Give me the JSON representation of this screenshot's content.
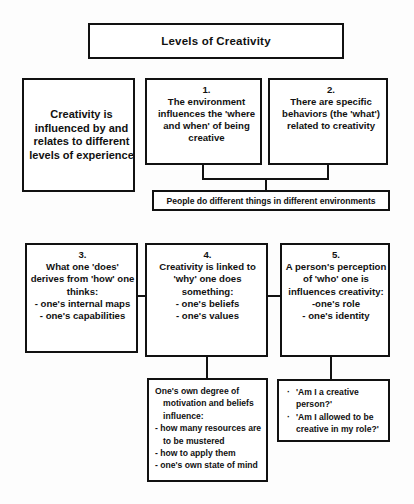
{
  "diagram": {
    "title": "Levels of Creativity",
    "intro": {
      "text": "Creativity is influenced by and relates to different levels of experience"
    },
    "level1": {
      "number": "1.",
      "text": "The environment influences the 'where and when' of being creative"
    },
    "level2": {
      "number": "2.",
      "text": "There are specific behaviors (the 'what') related to creativity"
    },
    "environment_note": "People do different things in different environments",
    "level3": {
      "number": "3.",
      "heading": "What one 'does' derives from 'how' one thinks:",
      "items": [
        "- one's internal maps",
        "- one's capabilities"
      ]
    },
    "level4": {
      "number": "4.",
      "heading": "Creativity is linked to 'why' one does something:",
      "items": [
        "- one's beliefs",
        "- one's values"
      ]
    },
    "level5": {
      "number": "5.",
      "heading": "A person's perception of 'who' one is influences creativity:",
      "items": [
        "-one's role",
        "- one's identity"
      ]
    },
    "detail4": {
      "lead": "One's own degree of",
      "lead2": "motivation and beliefs",
      "lead3": "influence:",
      "item1": "- how many resources are",
      "item1b": "to be mustered",
      "item2": "- how to apply them",
      "item3": "- one's own state of mind"
    },
    "detail5": {
      "bullet_glyph": "·",
      "item1a": "'Am I a creative",
      "item1b": "person?'",
      "item2a": "'Am I allowed to be",
      "item2b": "creative in my role?'"
    },
    "colors": {
      "line": "#111111",
      "background": "#ffffff"
    }
  }
}
